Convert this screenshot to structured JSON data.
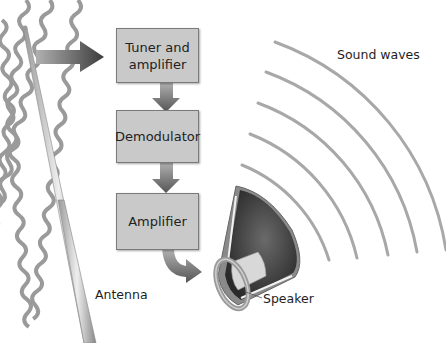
{
  "diagram": {
    "type": "radio-receiver-block-diagram",
    "blocks": [
      {
        "id": "tuner",
        "label_line1": "Tuner and",
        "label_line2": "amplifier"
      },
      {
        "id": "demodulator",
        "label": "Demodulator"
      },
      {
        "id": "amplifier",
        "label": "Amplifier"
      }
    ],
    "labels": {
      "antenna": "Antenna",
      "speaker": "Speaker",
      "sound_waves": "Sound waves"
    },
    "flow": [
      "radio waves",
      "Antenna",
      "Tuner and amplifier",
      "Demodulator",
      "Amplifier",
      "Speaker",
      "Sound waves"
    ],
    "colors": {
      "block_fill": "#c9c9c9",
      "block_border": "#7a7a7a",
      "arrow": "#555555",
      "radio_wave": "#9a9a9a",
      "sound_wave": "#a8a8a8",
      "speaker_cone": "#3a3a3a",
      "text": "#1e1e1e"
    },
    "radio_wave_count": 4,
    "sound_wave_count": 5
  }
}
